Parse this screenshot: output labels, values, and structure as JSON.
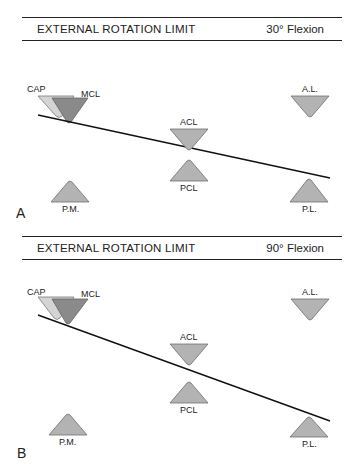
{
  "colors": {
    "triangle_fill": "#b3b3b3",
    "cap_fill": "#d4d4d4",
    "mcl_fill": "#8a8a8a",
    "stroke": "#6f6f6f",
    "line": "#111111"
  },
  "panels": [
    {
      "letter": "A",
      "title": "EXTERNAL ROTATION LIMIT",
      "flexion": "30° Flexion",
      "labels": {
        "cap": "CAP",
        "mcl": "MCL",
        "acl": "ACL",
        "pcl": "PCL",
        "al": "A.L.",
        "pl": "P.L.",
        "pm": "P.M."
      }
    },
    {
      "letter": "B",
      "title": "EXTERNAL ROTATION LIMIT",
      "flexion": "90° Flexion",
      "labels": {
        "cap": "CAP",
        "mcl": "MCL",
        "acl": "ACL",
        "pcl": "PCL",
        "al": "A.L.",
        "pl": "P.L.",
        "pm": "P.M."
      }
    }
  ]
}
